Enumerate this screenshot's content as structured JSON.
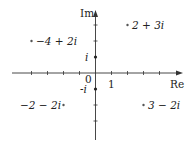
{
  "diagram": {
    "axes": {
      "x_label": "Re",
      "y_label": "Im",
      "origin_label": "0",
      "unit_label": "1",
      "i_label": "i",
      "neg_i_label": "-i"
    },
    "points": [
      {
        "re": 2,
        "im": 3,
        "label": "2 + 3i"
      },
      {
        "re": -4,
        "im": 2,
        "label": "−4 + 2i"
      },
      {
        "re": -2,
        "im": -2,
        "label": "−2 − 2i"
      },
      {
        "re": 3,
        "im": -2,
        "label": "3 − 2i"
      }
    ],
    "colors": {
      "ink": "#222222",
      "axis": "#333333"
    }
  }
}
